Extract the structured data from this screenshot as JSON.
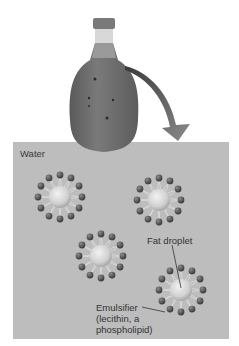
{
  "diagram": {
    "labels": {
      "water": "Water",
      "fat_droplet": "Fat droplet",
      "emulsifier_line1": "Emulsifier",
      "emulsifier_line2": "(lecithin, a",
      "emulsifier_line3": "phospholipid)"
    },
    "micelles": [
      {
        "cx": 60,
        "cy": 197
      },
      {
        "cx": 159,
        "cy": 200
      },
      {
        "cx": 101,
        "cy": 256
      },
      {
        "cx": 181,
        "cy": 290
      }
    ],
    "colors": {
      "water": "#bdbdbd",
      "head": "#4a4a4a",
      "droplet": "#dcdcdc",
      "bottle": "#6e6e6e",
      "cap": "#7a7a7a",
      "arrow": "#5a5a5a"
    }
  }
}
